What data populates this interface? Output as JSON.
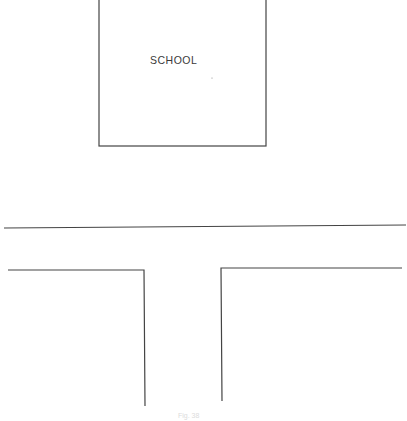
{
  "diagram": {
    "type": "site-plan",
    "school": {
      "label": "SCHOOL",
      "box": {
        "x": 99,
        "y": -2,
        "width": 167,
        "height": 148
      }
    },
    "road": {
      "top_edge": {
        "x1": 4,
        "y1": 228,
        "x2": 406,
        "y2": 225
      },
      "left_corner": {
        "points": "8,270 144,270 145,406"
      },
      "right_corner": {
        "points": "402,268 221,268 222,401"
      }
    },
    "caption": "Fig. 38",
    "line_color": "#444444"
  }
}
